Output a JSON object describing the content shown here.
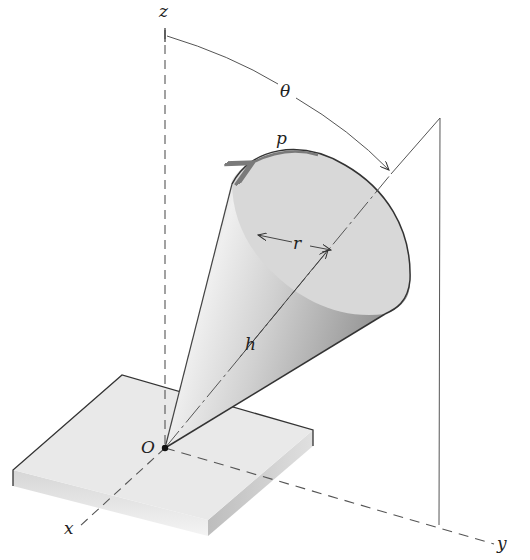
{
  "diagram": {
    "type": "3d-mechanics-figure",
    "labels": {
      "z_axis": "z",
      "x_axis": "x",
      "y_axis": "y",
      "origin": "O",
      "tilt_angle": "θ",
      "spin_rate": "p",
      "radius": "r",
      "height": "h"
    },
    "colors": {
      "line": "#333333",
      "dashed_axis": "#555555",
      "cone_light": "#e6e6e6",
      "cone_dark": "#9a9a9a",
      "cone_base": "#d9d9d9",
      "plate_top": "#e8e8e8",
      "plate_side": "#c9c9c9",
      "spin_arrow": "#7a7a7a"
    }
  }
}
